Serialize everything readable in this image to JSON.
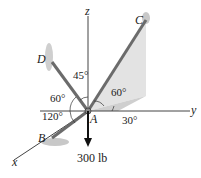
{
  "diagram": {
    "type": "statics-3d-force-system",
    "axes": {
      "x": "x",
      "y": "y",
      "z": "z"
    },
    "points": {
      "A": "A",
      "B": "B",
      "C": "C",
      "D": "D"
    },
    "angles": {
      "AD_z": "45°",
      "AD_horizontal": "60°",
      "AB_horizontal": "120°",
      "AC_vertical": "60°",
      "AC_projection_y": "30°"
    },
    "load": "300 lb",
    "colors": {
      "cable": "#6b6b6b",
      "axis": "#444444",
      "shade": "#d9d9d9",
      "load_arrow": "#111111"
    }
  }
}
